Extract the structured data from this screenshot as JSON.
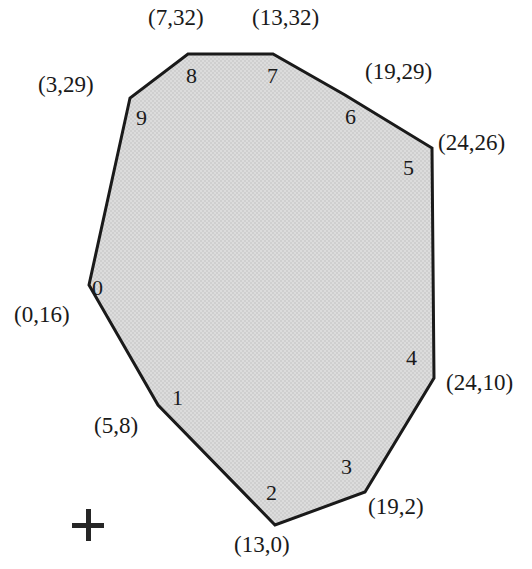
{
  "figure": {
    "kind": "labeled-polygon-diagram",
    "background_color": "#ffffff",
    "stroke_color": "#1a1a1a",
    "fill_color": "#d9d9d9",
    "stroke_width": 3,
    "canvas": {
      "width": 532,
      "height": 569
    }
  },
  "chart_data": {
    "type": "scatter",
    "title": "",
    "xlabel": "",
    "ylabel": "",
    "xlim": [
      0,
      24
    ],
    "ylim": [
      0,
      32
    ],
    "grid": false,
    "legend": null,
    "shape": "convex polygon with 10 labeled vertices traversed counter-clockwise starting at index 0",
    "categories": [
      "0",
      "1",
      "2",
      "3",
      "4",
      "5",
      "6",
      "7",
      "8",
      "9"
    ],
    "x": [
      0,
      5,
      13,
      19,
      24,
      24,
      19,
      13,
      7,
      3
    ],
    "y": [
      16,
      8,
      0,
      2,
      10,
      26,
      29,
      32,
      32,
      29
    ],
    "vertices": [
      {
        "index": "0",
        "coord_label": "(0,16)",
        "x": 0,
        "y": 16,
        "px": 89,
        "py": 285
      },
      {
        "index": "1",
        "coord_label": "(5,8)",
        "x": 5,
        "y": 8,
        "px": 158,
        "py": 405
      },
      {
        "index": "2",
        "coord_label": "(13,0)",
        "x": 13,
        "y": 0,
        "px": 275,
        "py": 525
      },
      {
        "index": "3",
        "coord_label": "(19,2)",
        "x": 19,
        "y": 2,
        "px": 365,
        "py": 492
      },
      {
        "index": "4",
        "coord_label": "(24,10)",
        "x": 24,
        "y": 10,
        "px": 434,
        "py": 378
      },
      {
        "index": "5",
        "coord_label": "(24,26)",
        "x": 24,
        "y": 26,
        "px": 432,
        "py": 148
      },
      {
        "index": "6",
        "coord_label": "(19,29)",
        "x": 19,
        "y": 29,
        "px": 345,
        "py": 95
      },
      {
        "index": "7",
        "coord_label": "(13,32)",
        "x": 13,
        "y": 32,
        "px": 273,
        "py": 54
      },
      {
        "index": "8",
        "coord_label": "(7,32)",
        "x": 7,
        "y": 32,
        "px": 188,
        "py": 54
      },
      {
        "index": "9",
        "coord_label": "(3,29)",
        "x": 3,
        "y": 29,
        "px": 130,
        "py": 98
      }
    ]
  },
  "coord_labels": [
    {
      "text": "(7,32)",
      "left": 148,
      "top": 6
    },
    {
      "text": "(13,32)",
      "left": 252,
      "top": 6
    },
    {
      "text": "(3,29)",
      "left": 38,
      "top": 73
    },
    {
      "text": "(19,29)",
      "left": 365,
      "top": 60
    },
    {
      "text": "(24,26)",
      "left": 438,
      "top": 131
    },
    {
      "text": "(0,16)",
      "left": 14,
      "top": 303
    },
    {
      "text": "(24,10)",
      "left": 446,
      "top": 371
    },
    {
      "text": "(5,8)",
      "left": 94,
      "top": 414
    },
    {
      "text": "(19,2)",
      "left": 368,
      "top": 495
    },
    {
      "text": "(13,0)",
      "left": 234,
      "top": 533
    }
  ],
  "vertex_indices": [
    {
      "text": "0",
      "left": 92,
      "top": 277
    },
    {
      "text": "1",
      "left": 172,
      "top": 387
    },
    {
      "text": "2",
      "left": 266,
      "top": 482
    },
    {
      "text": "3",
      "left": 341,
      "top": 456
    },
    {
      "text": "4",
      "left": 406,
      "top": 347
    },
    {
      "text": "5",
      "left": 403,
      "top": 157
    },
    {
      "text": "6",
      "left": 345,
      "top": 106
    },
    {
      "text": "7",
      "left": 267,
      "top": 65
    },
    {
      "text": "8",
      "left": 186,
      "top": 65
    },
    {
      "text": "9",
      "left": 136,
      "top": 107
    }
  ],
  "cross_mark": {
    "name": "plus-mark",
    "center_x": 88,
    "center_y": 525,
    "arm_length": 32,
    "thickness": 5,
    "color": "#262626"
  }
}
